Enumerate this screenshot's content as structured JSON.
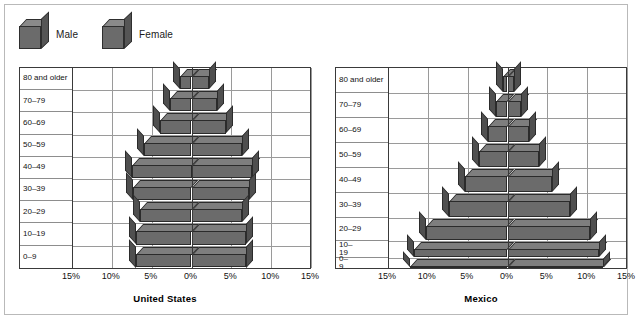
{
  "legend": {
    "items": [
      {
        "label": "Male",
        "icon": "cube-icon"
      },
      {
        "label": "Female",
        "icon": "cube-icon"
      }
    ]
  },
  "axis": {
    "ticks": [
      "15%",
      "10%",
      "5%",
      "0%",
      "5%",
      "10%",
      "15%"
    ]
  },
  "charts": [
    {
      "id": "united-states",
      "title": "United States",
      "age_labels": [
        "80 and older",
        "70–79",
        "60–69",
        "50–59",
        "40–49",
        "30–39",
        "20–29",
        "10–19",
        "0–9"
      ]
    },
    {
      "id": "mexico",
      "title": "Mexico",
      "age_labels": [
        "80 and older",
        "70–79",
        "60–69",
        "50–59",
        "40–49",
        "30–39",
        "20–29",
        "10–\n19",
        "0–\n9"
      ]
    }
  ],
  "chart_data": [
    {
      "type": "bar",
      "subtype": "population-pyramid",
      "title": "United States",
      "xlabel": "",
      "ylabel": "",
      "xlim": [
        -15,
        15
      ],
      "xticks": [
        -15,
        -10,
        -5,
        0,
        5,
        10,
        15
      ],
      "xticklabels": [
        "15%",
        "10%",
        "5%",
        "0%",
        "5%",
        "10%",
        "15%"
      ],
      "grid": true,
      "legend_position": "above-left",
      "categories": [
        "0–9",
        "10–19",
        "20–29",
        "30–39",
        "40–49",
        "50–59",
        "60–69",
        "70–79",
        "80 and older"
      ],
      "series": [
        {
          "name": "Male",
          "values": [
            7.0,
            7.0,
            6.5,
            7.3,
            7.5,
            6.0,
            4.0,
            2.7,
            1.5
          ]
        },
        {
          "name": "Female",
          "values": [
            6.8,
            6.8,
            6.3,
            7.2,
            7.6,
            6.3,
            4.3,
            3.2,
            2.2
          ]
        }
      ]
    },
    {
      "type": "bar",
      "subtype": "population-pyramid",
      "title": "Mexico",
      "xlabel": "",
      "ylabel": "",
      "xlim": [
        -15,
        15
      ],
      "xticks": [
        -15,
        -10,
        -5,
        0,
        5,
        10,
        15
      ],
      "xticklabels": [
        "15%",
        "10%",
        "5%",
        "0%",
        "5%",
        "10%",
        "15%"
      ],
      "grid": true,
      "legend_position": "above-left",
      "categories": [
        "0–9",
        "10–19",
        "20–29",
        "30–39",
        "40–49",
        "50–59",
        "60–69",
        "70–79",
        "80 and older"
      ],
      "series": [
        {
          "name": "Male",
          "values": [
            12.3,
            11.7,
            10.2,
            7.4,
            5.3,
            3.6,
            2.4,
            1.4,
            0.6
          ]
        },
        {
          "name": "Female",
          "values": [
            12.0,
            11.5,
            10.4,
            7.8,
            5.6,
            3.9,
            2.7,
            1.7,
            0.8
          ]
        }
      ]
    }
  ]
}
